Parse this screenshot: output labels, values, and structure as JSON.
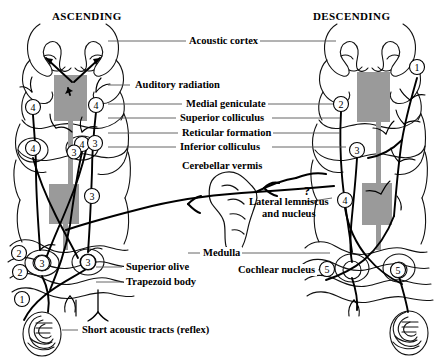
{
  "figure": {
    "type": "anatomical-diagram",
    "background_color": "#ffffff",
    "ink_color": "#000000",
    "block_color": "#9a9a9a"
  },
  "headers": {
    "left": "ASCENDING",
    "right": "DESCENDING"
  },
  "labels": {
    "acoustic_cortex": "Acoustic cortex",
    "auditory_radiation": "Auditory radiation",
    "medial_geniculate": "Medial geniculate",
    "superior_colliculus": "Superior colliculus",
    "reticular_formation": "Reticular formation",
    "inferior_colliculus": "Inferior colliculus",
    "cerebellar_vermis": "Cerebellar vermis",
    "lateral_lemniscus_line1": "Lateral lemniscus",
    "lateral_lemniscus_line2": "and nucleus",
    "medulla": "Medulla",
    "superior_olive": "Superior olive",
    "trapezoid_body": "Trapezoid body",
    "cochlear_nucleus": "Cochlear nucleus",
    "short_acoustic_tracts": "Short acoustic tracts (reflex)",
    "uncertainty_marker": "?"
  },
  "markers": {
    "left_side": [
      {
        "number": "4",
        "x": 33,
        "y": 107
      },
      {
        "number": "4",
        "x": 96,
        "y": 105
      },
      {
        "number": "4",
        "x": 33,
        "y": 148
      },
      {
        "number": "4",
        "x": 82,
        "y": 144
      },
      {
        "number": "3",
        "x": 74,
        "y": 152
      },
      {
        "number": "3",
        "x": 95,
        "y": 143
      },
      {
        "number": "3",
        "x": 92,
        "y": 196
      },
      {
        "number": "2",
        "x": 19,
        "y": 253
      },
      {
        "number": "3",
        "x": 42,
        "y": 263
      },
      {
        "number": "2",
        "x": 20,
        "y": 272
      },
      {
        "number": "3",
        "x": 88,
        "y": 262
      },
      {
        "number": "1",
        "x": 22,
        "y": 299
      }
    ],
    "right_side": [
      {
        "number": "1",
        "x": 417,
        "y": 67
      },
      {
        "number": "2",
        "x": 341,
        "y": 104
      },
      {
        "number": "3",
        "x": 357,
        "y": 150
      },
      {
        "number": "4",
        "x": 345,
        "y": 200
      },
      {
        "number": "5",
        "x": 327,
        "y": 269
      },
      {
        "number": "5",
        "x": 398,
        "y": 270
      }
    ]
  },
  "legend_note": "Circled numerals 1-5 mark successive relay levels of the auditory pathway"
}
